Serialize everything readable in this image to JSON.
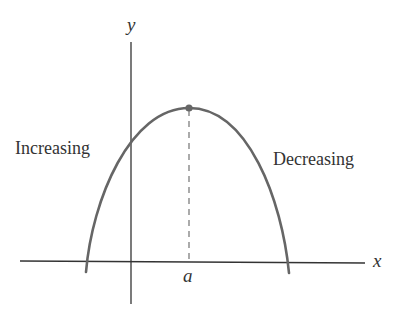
{
  "diagram": {
    "title": "",
    "labels": {
      "y_axis": "y",
      "x_axis": "x",
      "point": "a",
      "left_region": "Increasing",
      "right_region": "Decreasing"
    },
    "colors": {
      "axis": "#333333",
      "curve": "#666666",
      "dashed": "#666666",
      "text": "#333333"
    }
  }
}
